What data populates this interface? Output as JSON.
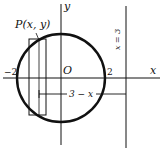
{
  "diagram": {
    "labels": {
      "point": "P(x, y)",
      "origin": "O",
      "x_axis": "x",
      "y_axis": "y",
      "neg_two": "−2",
      "pos_two": "2",
      "radius_expr": "3 − x",
      "line_label": "x = 3"
    },
    "circle": {
      "center": [
        0,
        0
      ],
      "radius": 2
    },
    "vertical_line": {
      "x": 3
    },
    "shell_rectangle": {
      "x_from": -1.5,
      "x_to": -0.7
    },
    "colors": {
      "stroke": "#111111",
      "background": "#ffffff"
    }
  }
}
